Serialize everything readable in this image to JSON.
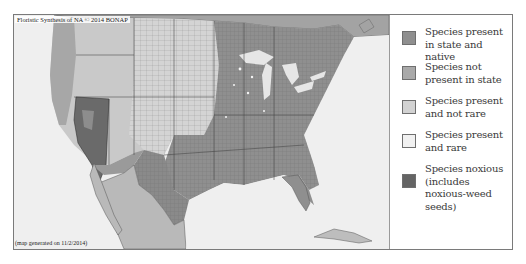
{
  "map": {
    "credit": "Floristic Synthesis of NA © 2014 BONAP",
    "generated": "(map generated on 11/2/2014)",
    "colors": {
      "ocean": "#efefef",
      "native": "#8a8a8a",
      "not_present": "#a8a8a8",
      "not_rare": "#cdcdcd",
      "rare": "#ececec",
      "noxious": "#5e5e5e",
      "county_line": "#7c7c7c",
      "state_line": "#3c3c3c"
    }
  },
  "legend": {
    "items": [
      {
        "label": "Species present in state and native",
        "color": "#8f8f8f"
      },
      {
        "label": "Species not present in state",
        "color": "#a9a9a9"
      },
      {
        "label": "Species present and not rare",
        "color": "#d2d2d2"
      },
      {
        "label": "Species present and rare",
        "color": "#f1f1f1"
      },
      {
        "label": "Species noxious (includes noxious-weed seeds)",
        "color": "#646464"
      }
    ]
  }
}
